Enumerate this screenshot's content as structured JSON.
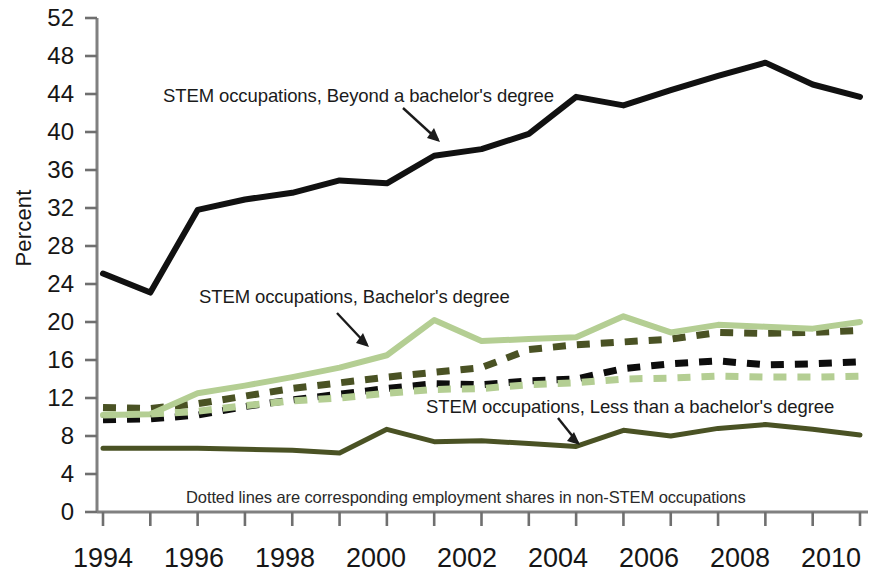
{
  "chart_data": {
    "type": "line",
    "title": "",
    "subtitle": "",
    "xlabel": "",
    "ylabel": "Percent",
    "xlim": [
      1994,
      2010
    ],
    "ylim": [
      0,
      52
    ],
    "ytick_step": 4,
    "yticks": [
      0,
      4,
      8,
      12,
      16,
      20,
      24,
      28,
      32,
      36,
      40,
      44,
      48,
      52
    ],
    "xticks_major": [
      1994,
      1996,
      1998,
      2000,
      2002,
      2004,
      2006,
      2008,
      2010
    ],
    "xticks_minor": [
      1995,
      1997,
      1999,
      2001,
      2003,
      2005,
      2007,
      2009
    ],
    "x": [
      1994,
      1995,
      1996,
      1997,
      1998,
      1999,
      2000,
      2001,
      2002,
      2003,
      2004,
      2005,
      2006,
      2007,
      2008,
      2009,
      2010
    ],
    "grid": false,
    "legend_position": "inline-annotations",
    "series": [
      {
        "name": "STEM occupations, Beyond a bachelor's degree",
        "style": "solid",
        "color": "#111111",
        "width": 6,
        "values": [
          25.1,
          23.1,
          31.8,
          32.9,
          33.6,
          34.9,
          34.6,
          37.5,
          38.2,
          39.8,
          43.7,
          42.8,
          44.4,
          45.9,
          47.3,
          45.0,
          43.7
        ]
      },
      {
        "name": "Non-STEM occupations, Beyond a bachelor's degree (dotted)",
        "style": "dotted",
        "color": "#4a5224",
        "width": 7,
        "values": [
          11.0,
          10.9,
          11.4,
          12.2,
          13.0,
          13.6,
          14.2,
          14.7,
          15.2,
          17.1,
          17.6,
          17.9,
          18.2,
          18.9,
          18.8,
          18.9,
          19.1
        ]
      },
      {
        "name": "STEM occupations, Bachelor's degree",
        "style": "solid",
        "color": "#b4ce93",
        "width": 6,
        "values": [
          10.2,
          10.3,
          12.5,
          13.3,
          14.2,
          15.2,
          16.5,
          20.2,
          18.0,
          18.2,
          18.4,
          20.6,
          18.9,
          19.7,
          19.5,
          19.3,
          20.0
        ]
      },
      {
        "name": "Non-STEM occupations, Bachelor's degree (dotted)",
        "style": "dotted",
        "color": "#0d0d0d",
        "width": 7,
        "values": [
          9.7,
          9.8,
          10.2,
          11.1,
          11.8,
          12.4,
          13.0,
          13.5,
          13.4,
          13.8,
          14.0,
          15.1,
          15.6,
          15.9,
          15.5,
          15.6,
          15.8
        ]
      },
      {
        "name": "Non-STEM occupations, Less than a bachelor's degree (dotted)",
        "style": "dotted",
        "color": "#b4ce93",
        "width": 7,
        "values": [
          10.2,
          10.3,
          10.6,
          11.2,
          11.7,
          12.0,
          12.5,
          12.9,
          13.0,
          13.4,
          13.6,
          14.0,
          14.1,
          14.3,
          14.2,
          14.2,
          14.3
        ]
      },
      {
        "name": "STEM occupations, Less than a bachelor's degree",
        "style": "solid",
        "color": "#4a5224",
        "width": 5,
        "values": [
          6.7,
          6.7,
          6.7,
          6.6,
          6.5,
          6.2,
          8.7,
          7.4,
          7.5,
          7.2,
          6.9,
          8.6,
          8.0,
          8.8,
          9.2,
          8.7,
          8.1
        ]
      }
    ],
    "annotations": [
      {
        "id": "label-beyond-bachelor",
        "text": "STEM occupations, Beyond a bachelor's degree"
      },
      {
        "id": "label-bachelor",
        "text": "STEM occupations, Bachelor's degree"
      },
      {
        "id": "label-less-than-bachelor",
        "text": "STEM occupations, Less than a bachelor's degree"
      },
      {
        "id": "footnote",
        "text": "Dotted lines are corresponding employment shares in non-STEM occupations"
      }
    ]
  },
  "axis": {
    "ylabel": "Percent",
    "ytick_labels": [
      "52",
      "48",
      "44",
      "40",
      "36",
      "32",
      "28",
      "24",
      "20",
      "16",
      "12",
      "8",
      "4",
      "0"
    ],
    "xtick_labels": [
      "1994",
      "1996",
      "1998",
      "2000",
      "2002",
      "2004",
      "2006",
      "2008",
      "2010"
    ]
  },
  "annotations": {
    "beyond_bachelor": "STEM occupations, Beyond a bachelor's degree",
    "bachelor": "STEM occupations, Bachelor's degree",
    "less_than_bachelor": "STEM occupations, Less than a bachelor's degree",
    "footnote": "Dotted lines are corresponding employment shares in non-STEM occupations"
  }
}
